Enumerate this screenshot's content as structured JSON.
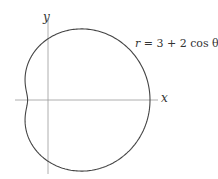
{
  "axes": {
    "x_label": "x",
    "y_label": "y"
  },
  "equation": {
    "lhs": "r",
    "rhs": "= 3 + 2 cos θ"
  },
  "chart_data": {
    "type": "line",
    "title": "",
    "curve": "limaçon",
    "equation": "r = 3 + 2 cos θ",
    "xlabel": "x",
    "ylabel": "y",
    "params": {
      "a": 3,
      "b": 2
    },
    "key_points": [
      {
        "theta": "0",
        "r": 5,
        "x": 5,
        "y": 0
      },
      {
        "theta": "π/2",
        "r": 3,
        "x": 0,
        "y": 3
      },
      {
        "theta": "π",
        "r": 1,
        "x": -1,
        "y": 0
      },
      {
        "theta": "3π/2",
        "r": 3,
        "x": 0,
        "y": -3
      }
    ],
    "grid": false,
    "legend": "none",
    "colors": {
      "curve": "#444444",
      "axes": "#999999"
    }
  }
}
